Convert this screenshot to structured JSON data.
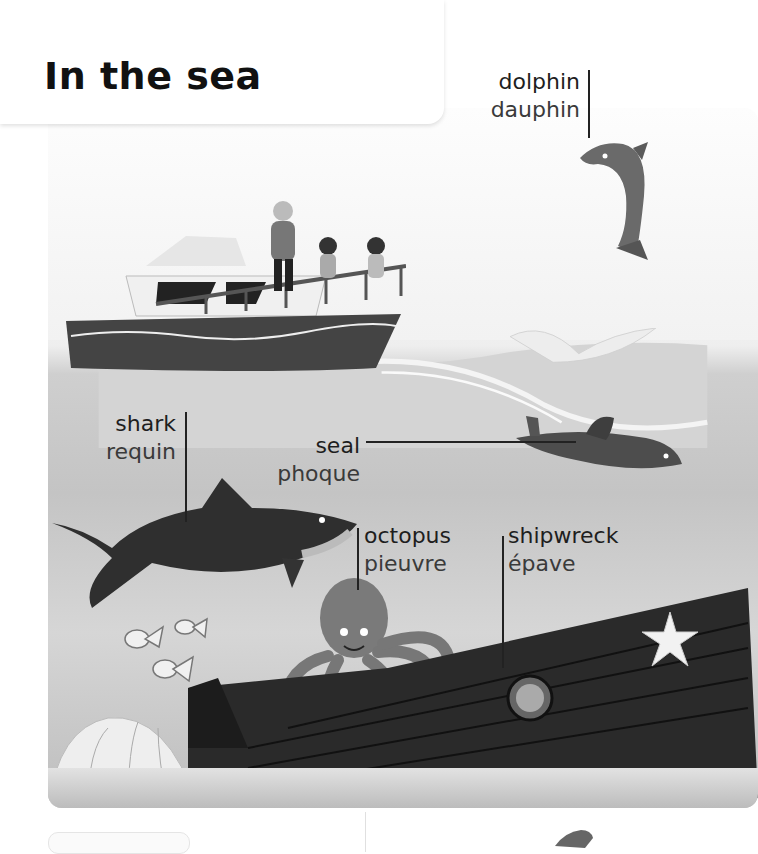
{
  "page": {
    "title": "In the sea"
  },
  "labels": {
    "dolphin": {
      "en": "dolphin",
      "fr": "dauphin"
    },
    "shark": {
      "en": "shark",
      "fr": "requin"
    },
    "seal": {
      "en": "seal",
      "fr": "phoque"
    },
    "octopus": {
      "en": "octopus",
      "fr": "pieuvre"
    },
    "shipwreck": {
      "en": "shipwreck",
      "fr": "épave"
    }
  },
  "illustration": {
    "scene": "ocean-scene",
    "elements": [
      "boat-with-family",
      "dolphin",
      "wave-splash",
      "seal",
      "shark",
      "octopus",
      "shipwreck",
      "starfish",
      "striped-fish",
      "giant-clam",
      "seaweed"
    ]
  }
}
